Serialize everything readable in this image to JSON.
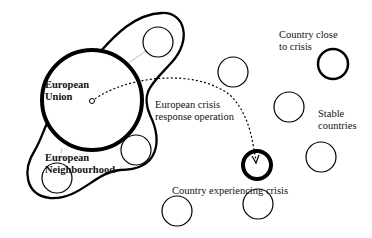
{
  "diagram": {
    "labels": {
      "eu_line1": "European",
      "eu_line2": "Union",
      "en_line1": "European",
      "en_line2": "Neighbourhood",
      "op_line1": "European crisis",
      "op_line2": "response operation",
      "crisis": "Country experiencing crisis",
      "close_line1": "Country close",
      "close_line2": "to crisis",
      "stable_line1": "Stable",
      "stable_line2": "countries"
    },
    "nodes": [
      {
        "id": "european-union",
        "cx": 92,
        "cy": 100,
        "r": 52,
        "stroke": 4
      },
      {
        "id": "neighbour-top",
        "cx": 158,
        "cy": 42,
        "r": 15,
        "stroke": 1.2
      },
      {
        "id": "neighbour-right",
        "cx": 136,
        "cy": 150,
        "r": 15,
        "stroke": 1.2
      },
      {
        "id": "neighbour-bottom",
        "cx": 57,
        "cy": 178,
        "r": 15,
        "stroke": 1.2
      },
      {
        "id": "crisis-country",
        "cx": 257,
        "cy": 165,
        "r": 14,
        "stroke": 4
      },
      {
        "id": "close-to-crisis",
        "cx": 333,
        "cy": 64,
        "r": 15,
        "stroke": 2.5
      },
      {
        "id": "stable-1",
        "cx": 233,
        "cy": 72,
        "r": 15,
        "stroke": 1.2
      },
      {
        "id": "stable-2",
        "cx": 289,
        "cy": 107,
        "r": 15,
        "stroke": 1.2
      },
      {
        "id": "stable-3",
        "cx": 321,
        "cy": 157,
        "r": 15,
        "stroke": 1.2
      },
      {
        "id": "stable-4",
        "cx": 177,
        "cy": 211,
        "r": 15,
        "stroke": 1.2
      },
      {
        "id": "stable-5",
        "cx": 258,
        "cy": 204,
        "r": 15,
        "stroke": 1.2
      },
      {
        "id": "stable-6",
        "cx": 172,
        "cy": 258,
        "r": 15,
        "stroke": 1.2
      }
    ],
    "edges": [
      {
        "from": "european-union",
        "to": "crisis-country",
        "style": "dotted-arrow",
        "label": "European crisis response operation"
      }
    ]
  }
}
